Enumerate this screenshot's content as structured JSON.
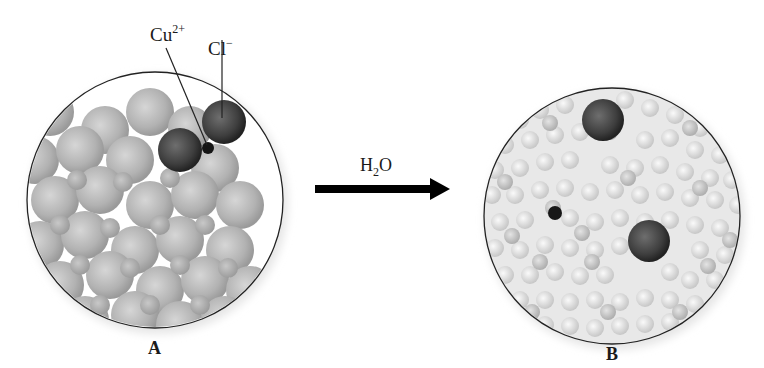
{
  "figure": {
    "panels": [
      {
        "id": "A",
        "label": "A",
        "description": "Solid CuCl2 crystal lattice"
      },
      {
        "id": "B",
        "label": "B",
        "description": "Dissolved ions surrounded by water molecules"
      }
    ],
    "ion_labels": {
      "cu": {
        "base": "Cu",
        "charge": "2+"
      },
      "cl": {
        "base": "Cl",
        "charge": "−"
      }
    },
    "arrow": {
      "base": "H",
      "sub": "2",
      "tail": "O"
    },
    "colors": {
      "circle_outline": "#222222",
      "lattice_ball": "#b5b5b5",
      "ion_dark": "#3a3a3a",
      "water": "#d9d9d9",
      "arrow": "#000000"
    }
  }
}
